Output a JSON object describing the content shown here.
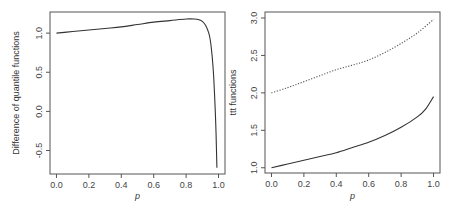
{
  "chart_data": [
    {
      "type": "line",
      "title": "",
      "xlabel": "p",
      "ylabel": "Difference of quantile functions",
      "xlim": [
        -0.04,
        1.04
      ],
      "ylim": [
        -0.8,
        1.27
      ],
      "xticks": [
        0.0,
        0.2,
        0.4,
        0.6,
        0.8,
        1.0
      ],
      "xtick_labels": [
        "0.0",
        "0.2",
        "0.4",
        "0.6",
        "0.8",
        "1.0"
      ],
      "yticks": [
        -0.5,
        0.0,
        0.5,
        1.0
      ],
      "ytick_labels": [
        "-0.5",
        "0.0",
        "0.5",
        "1.0"
      ],
      "grid": false,
      "legend": "none",
      "series": [
        {
          "name": "difference",
          "style": "solid",
          "x": [
            0.0,
            0.1,
            0.2,
            0.3,
            0.4,
            0.5,
            0.6,
            0.7,
            0.8,
            0.85,
            0.88,
            0.9,
            0.92,
            0.94,
            0.95,
            0.96,
            0.97,
            0.98,
            0.985,
            0.99
          ],
          "y": [
            1.0,
            1.02,
            1.04,
            1.06,
            1.08,
            1.11,
            1.14,
            1.16,
            1.18,
            1.18,
            1.17,
            1.15,
            1.1,
            1.0,
            0.9,
            0.72,
            0.45,
            0.0,
            -0.3,
            -0.72
          ]
        }
      ]
    },
    {
      "type": "line",
      "title": "",
      "xlabel": "p",
      "ylabel": "ttt functions",
      "xlim": [
        -0.04,
        1.04
      ],
      "ylim": [
        0.93,
        3.08
      ],
      "xticks": [
        0.0,
        0.2,
        0.4,
        0.6,
        0.8,
        1.0
      ],
      "xtick_labels": [
        "0.0",
        "0.2",
        "0.4",
        "0.6",
        "0.8",
        "1.0"
      ],
      "yticks": [
        1.0,
        1.5,
        2.0,
        2.5,
        3.0
      ],
      "ytick_labels": [
        "1.0",
        "1.5",
        "2.0",
        "2.5",
        "3.0"
      ],
      "grid": false,
      "legend": "none",
      "series": [
        {
          "name": "ttt-solid",
          "style": "solid",
          "x": [
            0.0,
            0.1,
            0.2,
            0.3,
            0.4,
            0.5,
            0.6,
            0.7,
            0.8,
            0.9,
            0.95,
            1.0
          ],
          "y": [
            1.0,
            1.05,
            1.1,
            1.15,
            1.2,
            1.27,
            1.34,
            1.43,
            1.54,
            1.68,
            1.78,
            1.95
          ]
        },
        {
          "name": "ttt-dotted",
          "style": "dotted",
          "x": [
            0.0,
            0.1,
            0.2,
            0.3,
            0.4,
            0.5,
            0.6,
            0.7,
            0.8,
            0.9,
            1.0
          ],
          "y": [
            2.0,
            2.07,
            2.15,
            2.23,
            2.31,
            2.37,
            2.44,
            2.54,
            2.66,
            2.8,
            2.98
          ]
        }
      ]
    }
  ]
}
